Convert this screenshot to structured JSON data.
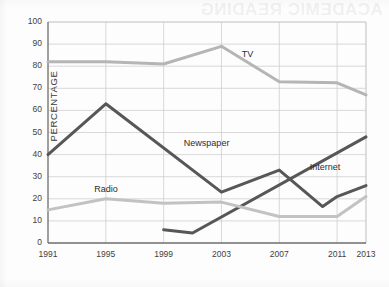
{
  "page": {
    "bleed_through_text": "ACADEMIC READING"
  },
  "chart_data": {
    "type": "line",
    "title": "",
    "xlabel": "",
    "ylabel": "PERCENTAGE",
    "xlim": [
      1991,
      2013
    ],
    "ylim": [
      0,
      100
    ],
    "grid": true,
    "legend_position": "inline-labels",
    "x_ticks": [
      "1991",
      "1995",
      "1999",
      "2003",
      "2007",
      "2011",
      "2013"
    ],
    "y_ticks": [
      "0",
      "10",
      "20",
      "30",
      "40",
      "50",
      "60",
      "70",
      "80",
      "90",
      "100"
    ],
    "series": [
      {
        "name": "TV",
        "color": "#b5b5b5",
        "label_x": 2004.4,
        "label_y": 85,
        "x": [
          1991,
          1995,
          1999,
          2003,
          2007,
          2011,
          2013
        ],
        "values": [
          82,
          82,
          81,
          89,
          73,
          72.5,
          67
        ]
      },
      {
        "name": "Newspaper",
        "color": "#575757",
        "label_x": 2000.4,
        "label_y": 45,
        "x": [
          1991,
          1995,
          2003,
          2007,
          2010,
          2011,
          2013
        ],
        "values": [
          40,
          63,
          23,
          33,
          16.5,
          21,
          26
        ]
      },
      {
        "name": "Radio",
        "color": "#c2c2c2",
        "label_x": 1994.2,
        "label_y": 24,
        "x": [
          1991,
          1995,
          1999,
          2003,
          2007,
          2011,
          2013
        ],
        "values": [
          15,
          20,
          18,
          18.5,
          12,
          12,
          21
        ]
      },
      {
        "name": "Internet",
        "color": "#575757",
        "label_x": 2009.1,
        "label_y": 34,
        "x": [
          1999,
          2001,
          2013
        ],
        "values": [
          6,
          4.5,
          48
        ]
      }
    ]
  }
}
